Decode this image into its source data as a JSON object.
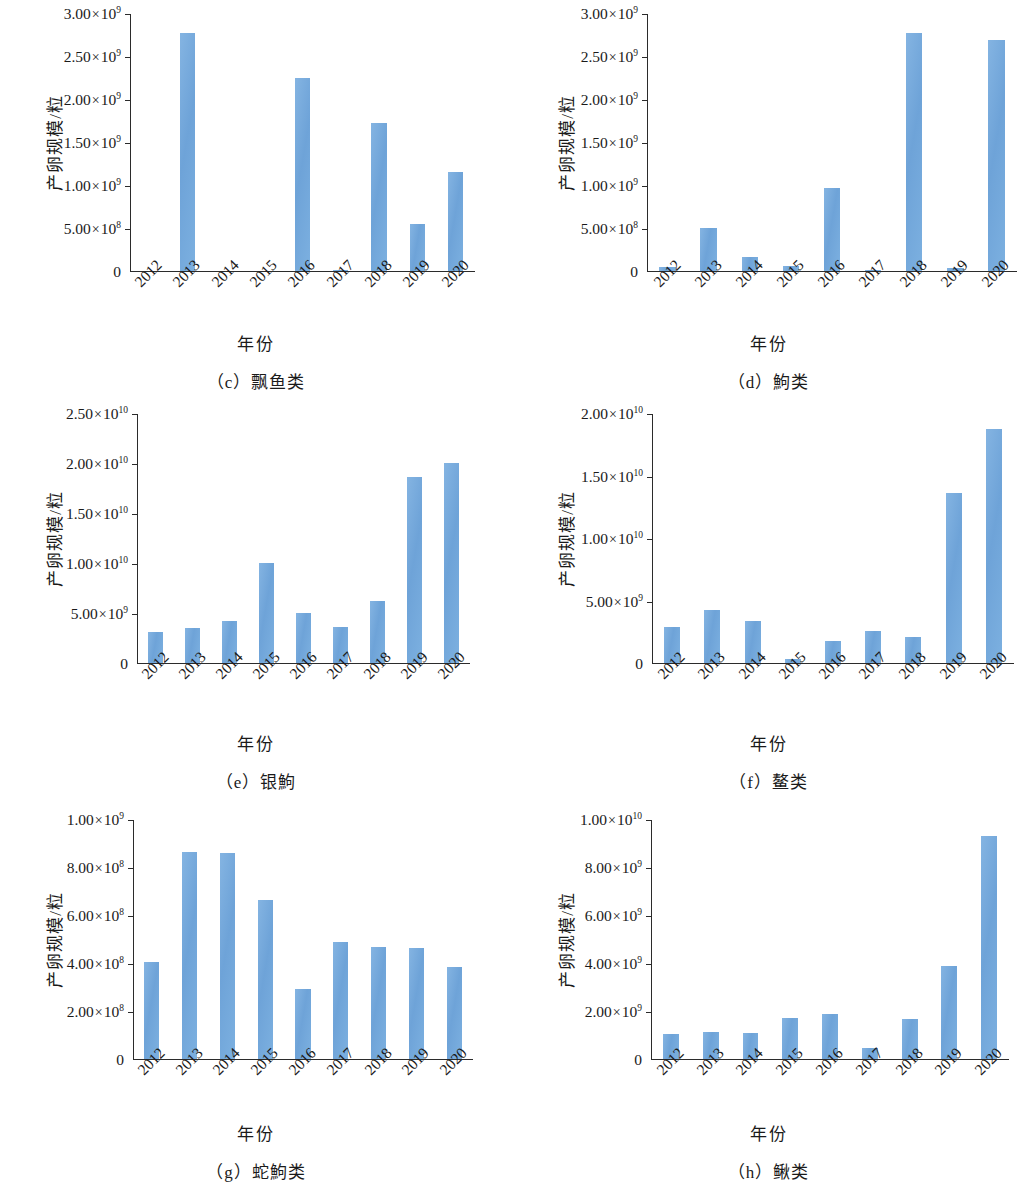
{
  "figure": {
    "y_axis_title": "产卵规模/粒",
    "x_axis_title": "年份",
    "bar_color": "#6ea3d8",
    "axis_color": "#2b2b2b",
    "background": "#ffffff"
  },
  "chart_data": [
    {
      "type": "bar",
      "panel": "c",
      "caption": "（c）飘鱼类",
      "title": "飘鱼类",
      "xlabel": "年份",
      "ylabel": "产卵规模/粒",
      "categories": [
        "2012",
        "2013",
        "2014",
        "2015",
        "2016",
        "2017",
        "2018",
        "2019",
        "2020"
      ],
      "values": [
        0,
        2760000000,
        0,
        0,
        2240000000,
        12000000,
        1720000000,
        540000000,
        1150000000
      ],
      "ylim": [
        0,
        3000000000
      ],
      "yticks": [
        0,
        500000000,
        1000000000,
        1500000000,
        2000000000,
        2500000000,
        3000000000
      ],
      "ytick_labels": [
        "0",
        "5.00×10<sup>8</sup>",
        "1.00×10<sup>9</sup>",
        "1.50×10<sup>9</sup>",
        "2.00×10<sup>9</sup>",
        "2.50×10<sup>9</sup>",
        "3.00×10<sup>9</sup>"
      ],
      "grid": false,
      "legend": null
    },
    {
      "type": "bar",
      "panel": "d",
      "caption": "（d）鮈类",
      "title": "鮈类",
      "xlabel": "年份",
      "ylabel": "产卵规模/粒",
      "categories": [
        "2012",
        "2013",
        "2014",
        "2015",
        "2016",
        "2017",
        "2018",
        "2019",
        "2020"
      ],
      "values": [
        45000000,
        500000000,
        155000000,
        55000000,
        965000000,
        9000000,
        2760000000,
        30000000,
        2680000000
      ],
      "ylim": [
        0,
        3000000000
      ],
      "yticks": [
        0,
        500000000,
        1000000000,
        1500000000,
        2000000000,
        2500000000,
        3000000000
      ],
      "ytick_labels": [
        "0",
        "5.00×10<sup>8</sup>",
        "1.00×10<sup>9</sup>",
        "1.50×10<sup>9</sup>",
        "2.00×10<sup>9</sup>",
        "2.50×10<sup>9</sup>",
        "3.00×10<sup>9</sup>"
      ],
      "grid": false,
      "legend": null
    },
    {
      "type": "bar",
      "panel": "e",
      "caption": "（e）银鮈",
      "title": "银鮈",
      "xlabel": "年份",
      "ylabel": "产卵规模/粒",
      "categories": [
        "2012",
        "2013",
        "2014",
        "2015",
        "2016",
        "2017",
        "2018",
        "2019",
        "2020"
      ],
      "values": [
        3100000000,
        3500000000,
        4150000000,
        10000000000,
        4950000000,
        3600000000,
        6150000000,
        18600000000,
        20000000000
      ],
      "ylim": [
        0,
        25000000000
      ],
      "yticks": [
        0,
        5000000000,
        10000000000,
        15000000000,
        20000000000,
        25000000000
      ],
      "ytick_labels": [
        "0",
        "5.00×10<sup>9</sup>",
        "1.00×10<sup>10</sup>",
        "1.50×10<sup>10</sup>",
        "2.00×10<sup>10</sup>",
        "2.50×10<sup>10</sup>"
      ],
      "grid": false,
      "legend": null
    },
    {
      "type": "bar",
      "panel": "f",
      "caption": "（f）鳌类",
      "title": "鳌类",
      "xlabel": "年份",
      "ylabel": "产卵规模/粒",
      "categories": [
        "2012",
        "2013",
        "2014",
        "2015",
        "2016",
        "2017",
        "2018",
        "2019",
        "2020"
      ],
      "values": [
        2850000000,
        4200000000,
        3300000000,
        300000000,
        1700000000,
        2500000000,
        2050000000,
        13600000000,
        18700000000
      ],
      "ylim": [
        0,
        20000000000
      ],
      "yticks": [
        0,
        5000000000,
        10000000000,
        15000000000,
        20000000000
      ],
      "ytick_labels": [
        "0",
        "5.00×10<sup>9</sup>",
        "1.00×10<sup>10</sup>",
        "1.50×10<sup>10</sup>",
        "2.00×10<sup>10</sup>"
      ],
      "grid": false,
      "legend": null
    },
    {
      "type": "bar",
      "panel": "g",
      "caption": "（g）蛇鮈类",
      "title": "蛇鮈类",
      "xlabel": "年份",
      "ylabel": "产卵规模/粒",
      "categories": [
        "2012",
        "2013",
        "2014",
        "2015",
        "2016",
        "2017",
        "2018",
        "2019",
        "2020"
      ],
      "values": [
        403000000,
        862000000,
        858000000,
        660000000,
        292000000,
        487000000,
        465000000,
        463000000,
        383000000
      ],
      "ylim": [
        0,
        1000000000
      ],
      "yticks": [
        0,
        200000000,
        400000000,
        600000000,
        800000000,
        1000000000
      ],
      "ytick_labels": [
        "0",
        "2.00×10<sup>8</sup>",
        "4.00×10<sup>8</sup>",
        "6.00×10<sup>8</sup>",
        "8.00×10<sup>8</sup>",
        "1.00×10<sup>9</sup>"
      ],
      "grid": false,
      "legend": null
    },
    {
      "type": "bar",
      "panel": "h",
      "caption": "（h）鳅类",
      "title": "鳅类",
      "xlabel": "年份",
      "ylabel": "产卵规模/粒",
      "categories": [
        "2012",
        "2013",
        "2014",
        "2015",
        "2016",
        "2017",
        "2018",
        "2019",
        "2020"
      ],
      "values": [
        1030000000,
        1120000000,
        1090000000,
        1680000000,
        1870000000,
        430000000,
        1670000000,
        3880000000,
        9270000000
      ],
      "ylim": [
        0,
        10000000000
      ],
      "yticks": [
        0,
        2000000000,
        4000000000,
        6000000000,
        8000000000,
        10000000000
      ],
      "ytick_labels": [
        "0",
        "2.00×10<sup>9</sup>",
        "4.00×10<sup>9</sup>",
        "6.00×10<sup>9</sup>",
        "8.00×10<sup>9</sup>",
        "1.00×10<sup>10</sup>"
      ],
      "grid": false,
      "legend": null
    }
  ]
}
